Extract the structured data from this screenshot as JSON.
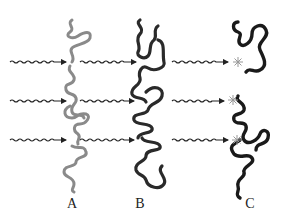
{
  "panels": [
    {
      "id": "A",
      "label": "A",
      "strand_color": "#8a8a8a",
      "label_x": 72
    },
    {
      "id": "B",
      "label": "B",
      "strand_color": "#2a2a2a",
      "label_x": 140
    },
    {
      "id": "C",
      "label": "C",
      "strand_color": "#1a1a1a",
      "label_x": 250
    }
  ],
  "arrows": {
    "rows_y": [
      62,
      100,
      140
    ],
    "count_per_row": 3,
    "style": "wavy-arrow"
  },
  "damage_marks": {
    "panel": "C",
    "count": 3,
    "color": "#999999"
  }
}
